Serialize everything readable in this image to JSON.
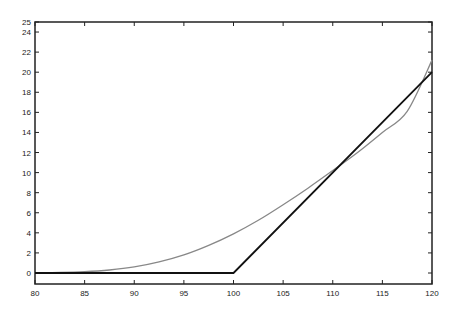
{
  "chart_data": {
    "type": "line",
    "title": "",
    "xlabel": "",
    "ylabel": "",
    "xlim": [
      80,
      120
    ],
    "ylim": [
      0,
      25
    ],
    "grid": false,
    "legend": null,
    "x_ticks": [
      80,
      85,
      90,
      95,
      100,
      105,
      110,
      115,
      120
    ],
    "y_ticks": [
      0,
      2,
      4,
      6,
      8,
      10,
      12,
      14,
      16,
      18,
      20,
      22,
      24,
      25
    ],
    "series": [
      {
        "name": "option value",
        "color": "#888888",
        "x": [
          80,
          82.5,
          85,
          87.5,
          90,
          92.5,
          95,
          97.5,
          100,
          102.5,
          105,
          107.5,
          110,
          112.5,
          115,
          117.5,
          120
        ],
        "y": [
          0.02,
          0.05,
          0.13,
          0.3,
          0.6,
          1.1,
          1.8,
          2.75,
          3.9,
          5.25,
          6.8,
          8.45,
          10.2,
          12.0,
          14.0,
          16.1,
          21.2
        ]
      },
      {
        "name": "payoff",
        "color": "#111111",
        "x": [
          80,
          100,
          120
        ],
        "y": [
          0,
          0,
          20
        ]
      }
    ]
  }
}
